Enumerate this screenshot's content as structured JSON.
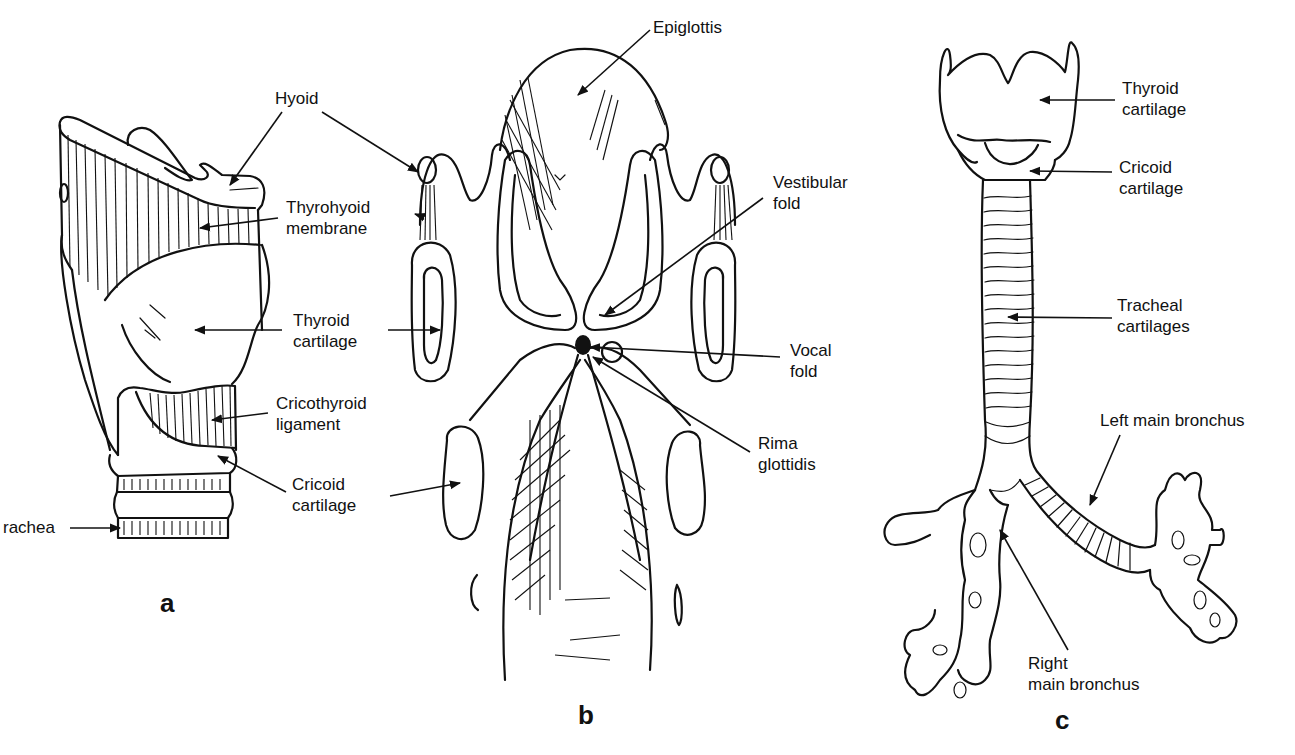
{
  "figure": {
    "panels": [
      {
        "id": "a",
        "letter": "a",
        "view": "lateral view of larynx",
        "labels": {
          "hyoid": "Hyoid",
          "thyrohyoid_line1": "Thyrohyoid",
          "thyrohyoid_line2": "membrane",
          "thyroid_line1": "Thyroid",
          "thyroid_line2": "cartilage",
          "cricothyroid_line1": "Cricothyroid",
          "cricothyroid_line2": "ligament",
          "cricoid_line1": "Cricoid",
          "cricoid_line2": "cartilage",
          "trachea": "rachea"
        }
      },
      {
        "id": "b",
        "letter": "b",
        "view": "posterior / coronal view of laryngeal interior",
        "labels": {
          "epiglottis": "Epiglottis",
          "vestibular_line1": "Vestibular",
          "vestibular_line2": "fold",
          "vocal_line1": "Vocal",
          "vocal_line2": "fold",
          "rima_line1": "Rima",
          "rima_line2": "glottidis"
        }
      },
      {
        "id": "c",
        "letter": "c",
        "view": "anterior view of larynx, trachea and bronchi",
        "labels": {
          "thyroid_line1": "Thyroid",
          "thyroid_line2": "cartilage",
          "cricoid_line1": "Cricoid",
          "cricoid_line2": "cartilage",
          "tracheal_line1": "Tracheal",
          "tracheal_line2": "cartilages",
          "left_bronchus": "Left main bronchus",
          "right_bronchus_line1": "Right",
          "right_bronchus_line2": "main bronchus"
        }
      }
    ],
    "colors": {
      "ink": "#111111",
      "paper": "#ffffff"
    }
  }
}
